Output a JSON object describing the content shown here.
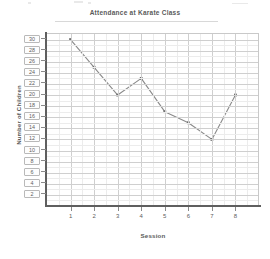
{
  "chart_data": {
    "type": "line",
    "title": "Attendance at Karate Class",
    "xlabel": "Session",
    "ylabel": "Number of Children",
    "x": [
      1,
      2,
      3,
      4,
      5,
      6,
      7,
      8
    ],
    "x_tick_labels": [
      "1",
      "2",
      "3",
      "4",
      "5",
      "6",
      "7",
      "8"
    ],
    "values": [
      30,
      25,
      20,
      23,
      17,
      15,
      12,
      20
    ],
    "y_tick_labels": [
      "30",
      "28",
      "26",
      "24",
      "22",
      "20",
      "18",
      "16",
      "14",
      "12",
      "10",
      "8",
      "6",
      "4",
      "2"
    ],
    "y_ticks": [
      30,
      28,
      26,
      24,
      22,
      20,
      18,
      16,
      14,
      12,
      10,
      8,
      6,
      4,
      2
    ],
    "ylim": [
      0,
      31
    ],
    "xlim": [
      0,
      9
    ],
    "grid": true,
    "legend": false,
    "series_color": "#8a8a8a",
    "marker": "square"
  }
}
